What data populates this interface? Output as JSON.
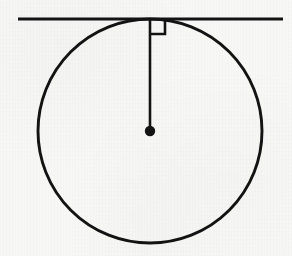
{
  "figure": {
    "kind": "geometry-diagram",
    "canvas": {
      "width": 292,
      "height": 256,
      "background_color": "#f7f7f6",
      "ink_color": "#141414"
    },
    "elements": {
      "tangent_line": {
        "name": "tangent-line",
        "x1": 18,
        "y1": 19,
        "x2": 283,
        "y2": 19,
        "stroke_width": 3.2,
        "color": "#141414"
      },
      "circle": {
        "name": "circle",
        "cx": 150,
        "cy": 131,
        "r": 112,
        "stroke_width": 2.9,
        "color": "#141414",
        "fill": "none"
      },
      "radius_segment": {
        "name": "radius-segment",
        "x1": 150,
        "y1": 19,
        "x2": 150,
        "y2": 131,
        "stroke_width": 2.6,
        "color": "#141414"
      },
      "right_angle_marker": {
        "name": "right-angle-marker",
        "corner_x": 150,
        "corner_y": 19,
        "size": 15,
        "direction": "down-right",
        "stroke_width": 2.6,
        "color": "#141414",
        "label": "90 degrees"
      },
      "center_point": {
        "name": "center-point",
        "cx": 150,
        "cy": 131,
        "r": 5.2,
        "color": "#141414"
      },
      "tangency_point": {
        "name": "tangency-point",
        "cx": 150,
        "cy": 19
      }
    },
    "labels": []
  }
}
